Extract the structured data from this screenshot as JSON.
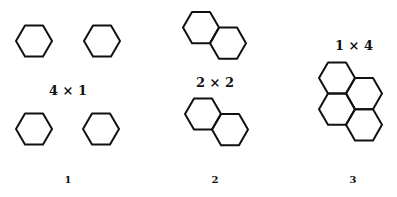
{
  "figure": {
    "groups": [
      {
        "index_label": "1",
        "dimension_label": "4 × 1",
        "description": "Four separate single hexagons arranged in a 2×2 grid"
      },
      {
        "index_label": "2",
        "dimension_label": "2 × 2",
        "description": "Two fused pairs of hexagons (naphthalene-like)"
      },
      {
        "index_label": "3",
        "dimension_label": "1 × 4",
        "description": "Four fused hexagons in a compact cluster (pyrene-like)"
      }
    ],
    "stroke_color": "#111111",
    "background_color": "#ffffff"
  }
}
